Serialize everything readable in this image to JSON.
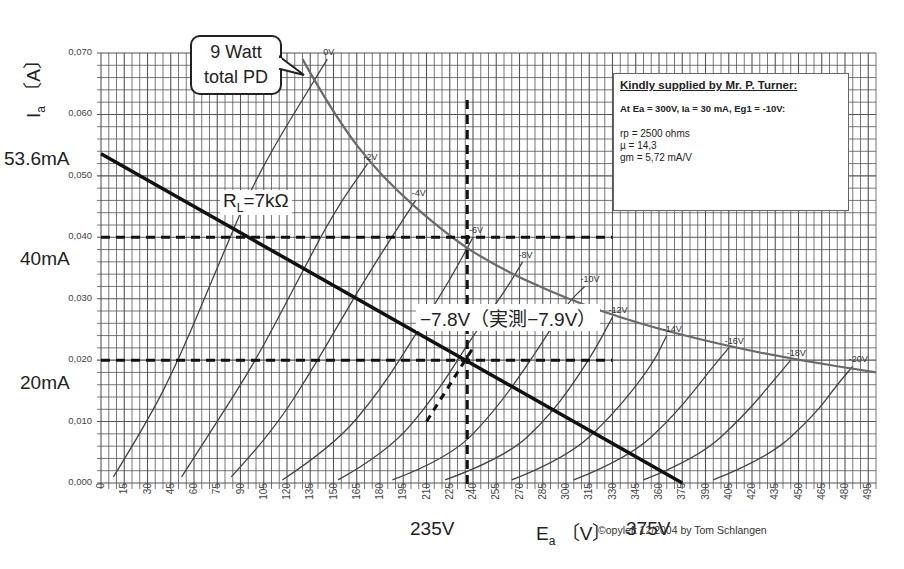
{
  "chart_data": {
    "type": "line",
    "xlabel": "Ea (V)",
    "ylabel": "Ia (A)",
    "xlim": [
      0,
      500
    ],
    "ylim": [
      0.0,
      0.07
    ],
    "grid": true,
    "x_ticks": [
      "0",
      "15",
      "30",
      "45",
      "60",
      "75",
      "90",
      "105",
      "120",
      "135",
      "150",
      "165",
      "180",
      "195",
      "210",
      "225",
      "240",
      "255",
      "270",
      "285",
      "300",
      "315",
      "330",
      "345",
      "360",
      "375",
      "390",
      "405",
      "420",
      "435",
      "450",
      "465",
      "480",
      "495"
    ],
    "y_ticks": [
      "0,000",
      "0,010",
      "0,020",
      "0,030",
      "0,040",
      "0,050",
      "0,060",
      "0,070"
    ],
    "series": [
      {
        "name": "0V",
        "points": [
          [
            8,
            0.001
          ],
          [
            30,
            0.01
          ],
          [
            50,
            0.02
          ],
          [
            75,
            0.035
          ],
          [
            100,
            0.05
          ],
          [
            146,
            0.069
          ]
        ]
      },
      {
        "name": "-2V",
        "points": [
          [
            52,
            0.001
          ],
          [
            75,
            0.01
          ],
          [
            100,
            0.02
          ],
          [
            125,
            0.032
          ],
          [
            150,
            0.044
          ],
          [
            172,
            0.052
          ]
        ]
      },
      {
        "name": "-4V",
        "points": [
          [
            84,
            0.001
          ],
          [
            110,
            0.008
          ],
          [
            140,
            0.02
          ],
          [
            165,
            0.031
          ],
          [
            190,
            0.041
          ],
          [
            203,
            0.046
          ]
        ]
      },
      {
        "name": "-6V",
        "points": [
          [
            117,
            0.0005
          ],
          [
            150,
            0.006
          ],
          [
            180,
            0.015
          ],
          [
            205,
            0.025
          ],
          [
            225,
            0.033
          ],
          [
            240,
            0.04
          ]
        ]
      },
      {
        "name": "-8V",
        "points": [
          [
            153,
            0.0005
          ],
          [
            185,
            0.005
          ],
          [
            215,
            0.014
          ],
          [
            240,
            0.024
          ],
          [
            260,
            0.031
          ],
          [
            272,
            0.036
          ]
        ]
      },
      {
        "name": "-10V",
        "points": [
          [
            188,
            0.0005
          ],
          [
            225,
            0.004
          ],
          [
            255,
            0.012
          ],
          [
            280,
            0.021
          ],
          [
            300,
            0.029
          ],
          [
            312,
            0.032
          ]
        ]
      },
      {
        "name": "-12V",
        "points": [
          [
            222,
            0.0005
          ],
          [
            260,
            0.004
          ],
          [
            290,
            0.011
          ],
          [
            315,
            0.02
          ],
          [
            330,
            0.027
          ]
        ]
      },
      {
        "name": "-14V",
        "points": [
          [
            265,
            0.0005
          ],
          [
            300,
            0.004
          ],
          [
            330,
            0.011
          ],
          [
            355,
            0.019
          ],
          [
            365,
            0.024
          ]
        ]
      },
      {
        "name": "-16V",
        "points": [
          [
            305,
            0.0005
          ],
          [
            340,
            0.004
          ],
          [
            370,
            0.011
          ],
          [
            395,
            0.019
          ],
          [
            405,
            0.022
          ]
        ]
      },
      {
        "name": "-18V",
        "points": [
          [
            350,
            0.0005
          ],
          [
            385,
            0.004
          ],
          [
            415,
            0.011
          ],
          [
            435,
            0.017
          ],
          [
            445,
            0.02
          ]
        ]
      },
      {
        "name": "-20V",
        "points": [
          [
            395,
            0.0005
          ],
          [
            430,
            0.004
          ],
          [
            460,
            0.011
          ],
          [
            475,
            0.016
          ],
          [
            485,
            0.019
          ]
        ]
      },
      {
        "name": "9 Watt total PD",
        "points": [
          [
            130,
            0.069
          ],
          [
            150,
            0.06
          ],
          [
            180,
            0.05
          ],
          [
            225,
            0.04
          ],
          [
            257,
            0.035
          ],
          [
            300,
            0.03
          ],
          [
            346,
            0.026
          ],
          [
            400,
            0.0225
          ],
          [
            450,
            0.02
          ],
          [
            500,
            0.018
          ]
        ]
      },
      {
        "name": "RL=7kΩ load line",
        "points": [
          [
            0,
            0.0536
          ],
          [
            375,
            0.0
          ]
        ]
      }
    ],
    "reference_lines": {
      "horizontal": [
        0.04,
        0.02
      ],
      "vertical": [
        235
      ],
      "bias_curve_dashed": [
        [
          210,
          0.01
        ],
        [
          235,
          0.02
        ],
        [
          240,
          0.022
        ]
      ]
    },
    "annotations": [
      "53.6mA",
      "40mA",
      "20mA",
      "235V",
      "375V",
      "RL=7kΩ",
      "-7.8V（実測-7.9V）",
      "9 Watt total PD"
    ]
  },
  "labels": {
    "y_axis_title": "Ia",
    "y_axis_sub": "a",
    "y_axis_unit": "〔A〕",
    "x_axis_title": "E",
    "x_axis_sub": "a",
    "x_axis_unit": "〔V〕",
    "ann_53": "53.6mA",
    "ann_40": "40mA",
    "ann_20": "20mA",
    "ann_235": "235V",
    "ann_375": "375V",
    "load_R": "R",
    "load_sub": "L",
    "load_val": "=7kΩ",
    "bias": "−7.8V（実測−7.9V）",
    "callout_line1": "9 Watt",
    "callout_line2": "total PD",
    "copyright": "©opyleft 12/2004 by Tom Schlangen"
  },
  "infobox": {
    "title": "Kindly supplied by Mr. P. Turner:",
    "condition": "At Ea = 300V, Ia = 30 mA, Eg1 = -10V:",
    "rows": [
      "rp  = 2500 ohms",
      "µ   = 14,3",
      "gm = 5,72 mA/V"
    ]
  },
  "colors": {
    "grid": "#555555",
    "curve": "#444444",
    "pd_curve": "#6a6a6a",
    "load_line": "#111111",
    "dashed": "#111111"
  }
}
